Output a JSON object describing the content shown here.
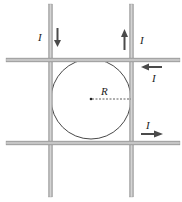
{
  "figure": {
    "labels": {
      "current_top_left": "I",
      "current_top_right": "I",
      "current_right_upper": "I",
      "current_right_lower": "I",
      "radius": "R"
    },
    "wires": [
      {
        "id": "left-vertical",
        "orientation": "vertical",
        "current_direction": "down"
      },
      {
        "id": "right-vertical",
        "orientation": "vertical",
        "current_direction": "up"
      },
      {
        "id": "top-horizontal",
        "orientation": "horizontal",
        "current_direction": "left"
      },
      {
        "id": "bottom-horizontal",
        "orientation": "horizontal",
        "current_direction": "right"
      }
    ],
    "colors": {
      "wire_fill": "#b8b8b8",
      "wire_edge": "#8a8a8a",
      "arrow": "#4a4a4a",
      "circle": "#333333"
    }
  }
}
